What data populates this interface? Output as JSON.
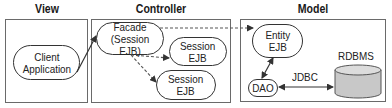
{
  "titles": {
    "view": "View",
    "controller": "Controller",
    "model": "Model"
  },
  "view": {
    "client_line1": "Client",
    "client_line2": "Application"
  },
  "controller": {
    "facade_line1": "Facade",
    "facade_line2": "(Session EJB)",
    "session1_line1": "Session",
    "session1_line2": "EJB",
    "session2_line1": "Session",
    "session2_line2": "EJB"
  },
  "model": {
    "entity_line1": "Entity",
    "entity_line2": "EJB",
    "dao": "DAO",
    "jdbc": "JDBC",
    "rdbms": "RDBMS"
  },
  "colors": {
    "frame": "#6a6a6a",
    "stroke": "#333333",
    "cylinder_fill": "#c8c8c8",
    "cylinder_top": "#dcdcdc"
  }
}
